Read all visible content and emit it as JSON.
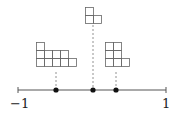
{
  "axis": {
    "min_label": "−1",
    "max_label": "1",
    "x_start": 18,
    "x_end": 166,
    "y": 90
  },
  "points": [
    {
      "name": "point-left",
      "x": 56
    },
    {
      "name": "point-middle",
      "x": 93
    },
    {
      "name": "point-right",
      "x": 116
    }
  ],
  "diagrams": [
    {
      "name": "young-diagram-left",
      "x": 36,
      "y": 42,
      "cell": 8,
      "rows": [
        1,
        4,
        5
      ],
      "stem_x": 56,
      "stem_y1": 72,
      "stem_y2": 88
    },
    {
      "name": "young-diagram-middle",
      "x": 85,
      "y": 7,
      "cell": 8,
      "rows": [
        1,
        2
      ],
      "stem_x": 93,
      "stem_y1": 25,
      "stem_y2": 88
    },
    {
      "name": "young-diagram-right",
      "x": 105,
      "y": 42,
      "cell": 8,
      "rows": [
        2,
        2,
        3
      ],
      "stem_x": 116,
      "stem_y1": 72,
      "stem_y2": 88
    }
  ],
  "colors": {
    "axis": "#555555",
    "grid": "#666666",
    "dot": "#111111",
    "stem": "#777777"
  }
}
